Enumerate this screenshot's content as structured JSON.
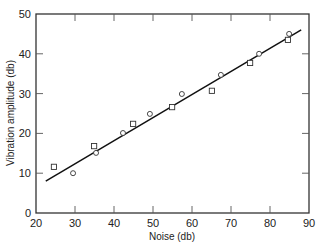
{
  "chart_data": {
    "type": "scatter",
    "title": "",
    "xlabel": "Noise (db)",
    "ylabel": "Vibration amplitude (db)",
    "xlim": [
      20,
      90
    ],
    "ylim": [
      0,
      50
    ],
    "xticks": [
      20,
      30,
      40,
      50,
      60,
      70,
      80,
      90
    ],
    "yticks": [
      0,
      10,
      20,
      30,
      40,
      50
    ],
    "grid": false,
    "legend": null,
    "series": [
      {
        "name": "squares",
        "marker": "square",
        "x": [
          24.6,
          34.9,
          44.9,
          54.9,
          65.1,
          74.9,
          84.6
        ],
        "y": [
          11.6,
          16.8,
          22.4,
          26.6,
          30.7,
          37.7,
          43.5
        ]
      },
      {
        "name": "circles",
        "marker": "circle",
        "x": [
          29.5,
          35.4,
          42.3,
          49.2,
          57.4,
          67.4,
          77.2,
          84.9
        ],
        "y": [
          10.0,
          15.1,
          20.1,
          24.9,
          29.9,
          34.7,
          40.0,
          45.0
        ]
      },
      {
        "name": "fit-line",
        "marker": "line",
        "x": [
          22.5,
          88.0
        ],
        "y": [
          8.0,
          46.0
        ]
      }
    ]
  }
}
